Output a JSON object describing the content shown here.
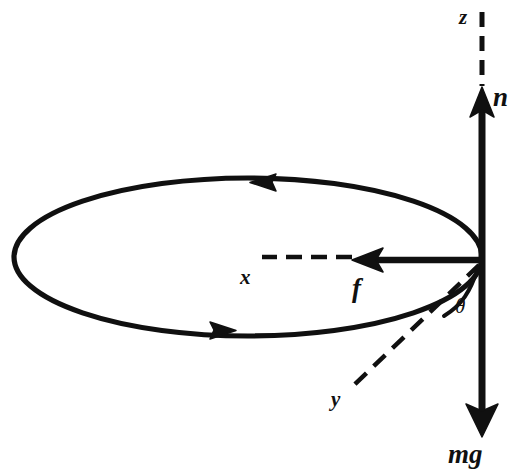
{
  "figure": {
    "background_color": "#ffffff",
    "ink_color": "#101010",
    "labels": {
      "z_axis": "z",
      "normal_force": "n",
      "friction_force": "f",
      "x_axis": "x",
      "y_axis": "y",
      "angle": "θ",
      "weight": "mg"
    },
    "vectors": [
      {
        "name": "n",
        "label": "n",
        "direction": "up",
        "style": "solid-bold-arrow"
      },
      {
        "name": "mg",
        "label": "mg",
        "direction": "down",
        "style": "solid-bold-arrow"
      },
      {
        "name": "f",
        "label": "f",
        "direction": "left",
        "style": "solid-bold-arrow"
      }
    ],
    "axes": [
      {
        "name": "z",
        "label": "z",
        "direction": "up",
        "style": "dashed"
      },
      {
        "name": "x",
        "label": "x",
        "direction": "left",
        "style": "dashed"
      },
      {
        "name": "y",
        "label": "y",
        "direction": "down-left",
        "style": "dashed"
      }
    ],
    "path": {
      "name": "circular-path",
      "shape": "ellipse",
      "style": "solid-bold",
      "direction_markers": [
        {
          "position": "top",
          "direction": "left"
        },
        {
          "position": "bottom",
          "direction": "right"
        }
      ]
    },
    "angle_arc": {
      "name": "theta",
      "label": "θ",
      "between": [
        "z-axis",
        "y-axis"
      ]
    }
  }
}
